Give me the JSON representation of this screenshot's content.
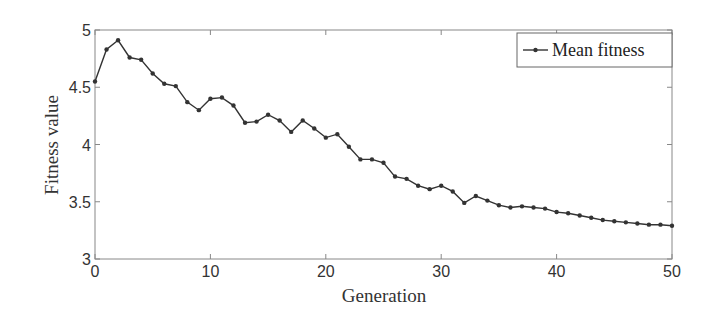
{
  "chart_data": {
    "type": "line",
    "title": "",
    "xlabel": "Generation",
    "ylabel": "Fitness value",
    "xlim": [
      0,
      50
    ],
    "ylim": [
      3,
      5
    ],
    "xticks": [
      "0",
      "10",
      "20",
      "30",
      "40",
      "50"
    ],
    "yticks": [
      "3",
      "3.5",
      "4",
      "4.5",
      "5"
    ],
    "grid": false,
    "legend_position": "upper right",
    "x": [
      0,
      1,
      2,
      3,
      4,
      5,
      6,
      7,
      8,
      9,
      10,
      11,
      12,
      13,
      14,
      15,
      16,
      17,
      18,
      19,
      20,
      21,
      22,
      23,
      24,
      25,
      26,
      27,
      28,
      29,
      30,
      31,
      32,
      33,
      34,
      35,
      36,
      37,
      38,
      39,
      40,
      41,
      42,
      43,
      44,
      45,
      46,
      47,
      48,
      49,
      50
    ],
    "series": [
      {
        "name": "Mean fitness",
        "color": "#333333",
        "marker": "dot",
        "values": [
          4.55,
          4.83,
          4.91,
          4.76,
          4.74,
          4.62,
          4.53,
          4.51,
          4.37,
          4.3,
          4.4,
          4.41,
          4.34,
          4.19,
          4.2,
          4.26,
          4.21,
          4.11,
          4.21,
          4.14,
          4.06,
          4.09,
          3.98,
          3.87,
          3.87,
          3.84,
          3.72,
          3.7,
          3.64,
          3.61,
          3.64,
          3.59,
          3.49,
          3.55,
          3.51,
          3.47,
          3.45,
          3.46,
          3.45,
          3.44,
          3.41,
          3.4,
          3.38,
          3.36,
          3.34,
          3.33,
          3.32,
          3.31,
          3.3,
          3.3,
          3.29
        ]
      }
    ]
  }
}
